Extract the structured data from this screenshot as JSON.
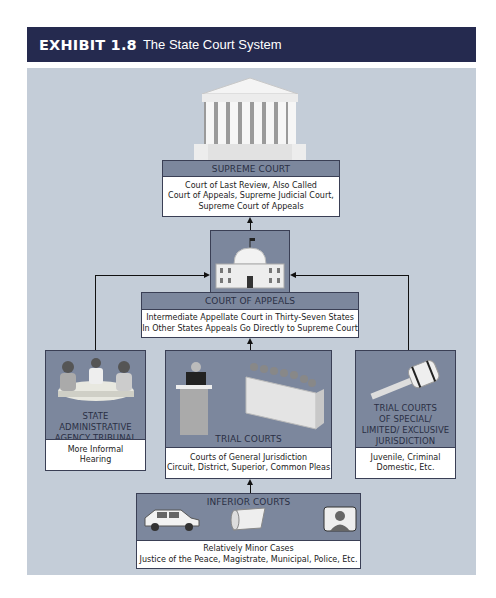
{
  "header": {
    "exhibit": "EXHIBIT 1.8",
    "title": "The State Court System"
  },
  "colors": {
    "header_bg": "#252a4f",
    "panel_bg": "#c4cdd8",
    "box_bg": "#7c879d",
    "box_body": "#ffffff"
  },
  "supreme_court": {
    "icon": "supreme-court-building-icon",
    "title": "SUPREME COURT",
    "lines": [
      "Court of Last Review, Also Called",
      "Court of Appeals, Supreme Judicial Court,",
      "Supreme Court of Appeals"
    ]
  },
  "court_of_appeals": {
    "icon": "capitol-building-icon",
    "title": "COURT OF APPEALS",
    "lines": [
      "Intermediate Appellate Court in Thirty-Seven States",
      "In Other States Appeals Go Directly to Supreme Court"
    ]
  },
  "state_admin": {
    "icon": "meeting-table-icon",
    "title_lines": [
      "STATE",
      "ADMINISTRATIVE",
      "AGENCY TRIBUNAL"
    ],
    "lines": [
      "More Informal",
      "Hearing"
    ]
  },
  "trial_courts": {
    "icon": "courtroom-jury-icon",
    "title": "TRIAL COURTS",
    "lines": [
      "Courts of General Jurisdiction",
      "Circuit, District, Superior, Common Pleas"
    ]
  },
  "special_courts": {
    "icon": "gavel-icon",
    "title_lines": [
      "TRIAL COURTS",
      "OF SPECIAL/",
      "LIMITED/ EXCLUSIVE",
      "JURISDICTION"
    ],
    "lines": [
      "Juvenile, Criminal",
      "Domestic, Etc."
    ]
  },
  "inferior_courts": {
    "icons": [
      "car-icon",
      "scroll-icon",
      "person-portrait-icon"
    ],
    "title": "INFERIOR COURTS",
    "lines": [
      "Relatively Minor Cases",
      "Justice of the Peace, Magistrate, Municipal, Police, Etc."
    ]
  }
}
